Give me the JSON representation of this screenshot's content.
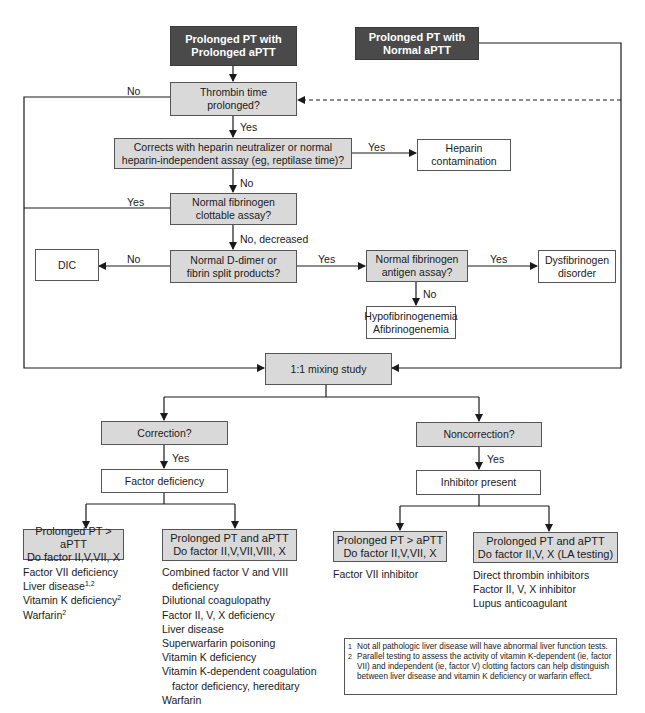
{
  "start_nodes": {
    "prolonged_both": [
      "Prolonged PT with",
      "Prolonged aPTT"
    ],
    "prolonged_pt_only": [
      "Prolonged PT with",
      "Normal aPTT"
    ]
  },
  "nodes": {
    "thrombin_time": [
      "Thrombin time",
      "prolonged?"
    ],
    "heparin_neutralizer": [
      "Corrects with heparin neutralizer or normal",
      "heparin-independent assay (eg, reptilase time)?"
    ],
    "heparin_contamination": [
      "Heparin",
      "contamination"
    ],
    "fibrinogen_clottable": [
      "Normal fibrinogen",
      "clottable assay?"
    ],
    "ddimer": [
      "Normal D-dimer or",
      "fibrin split products?"
    ],
    "dic": [
      "DIC"
    ],
    "fibrinogen_antigen": [
      "Normal fibrinogen",
      "antigen assay?"
    ],
    "dysfibrinogen": [
      "Dysfibrinogen",
      "disorder"
    ],
    "hypofibrinogenemia": [
      "Hypofibrinogenemia",
      "Afibrinogenemia"
    ],
    "mixing_study": [
      "1:1 mixing study"
    ],
    "correction": [
      "Correction?"
    ],
    "noncorrection": [
      "Noncorrection?"
    ],
    "factor_deficiency": [
      "Factor deficiency"
    ],
    "inhibitor_present": [
      "Inhibitor present"
    ],
    "def_pt_gt_aptt": [
      "Prolonged PT > aPTT",
      "Do factor II,V,VII, X"
    ],
    "def_pt_and_aptt": [
      "Prolonged PT and aPTT",
      "Do factor II,V,VII,VIII, X"
    ],
    "inh_pt_gt_aptt": [
      "Prolonged PT > aPTT",
      "Do factor II,V,VII, X"
    ],
    "inh_pt_and_aptt": [
      "Prolonged PT and aPTT",
      "Do factor II,V, X (LA testing)"
    ]
  },
  "edge_labels": {
    "thrombin_no": "No",
    "thrombin_yes": "Yes",
    "heparin_yes": "Yes",
    "heparin_no": "No",
    "fibrinogen_yes": "Yes",
    "fibrinogen_no": "No, decreased",
    "ddimer_no": "No",
    "ddimer_yes": "Yes",
    "antigen_yes": "Yes",
    "antigen_no": "No",
    "correction_yes": "Yes",
    "noncorrection_yes": "Yes"
  },
  "lists": {
    "def_pt_gt_aptt": [
      {
        "text": "Factor VII deficiency",
        "sup": ""
      },
      {
        "text": "Liver disease",
        "sup": "1,2"
      },
      {
        "text": "Vitamin K deficiency",
        "sup": "2"
      },
      {
        "text": "Warfarin",
        "sup": "2"
      }
    ],
    "def_pt_and_aptt": [
      {
        "text": "Combined factor V and VIII"
      },
      {
        "text": "deficiency",
        "indent": true
      },
      {
        "text": "Dilutional coagulopathy"
      },
      {
        "text": "Factor II, V, X deficiency"
      },
      {
        "text": "Liver disease"
      },
      {
        "text": "Superwarfarin poisoning"
      },
      {
        "text": "Vitamin K deficiency"
      },
      {
        "text": "Vitamin K-dependent coagulation"
      },
      {
        "text": "factor deficiency, hereditary",
        "indent": true
      },
      {
        "text": "Warfarin"
      }
    ],
    "inh_pt_gt_aptt": [
      {
        "text": "Factor VII inhibitor"
      }
    ],
    "inh_pt_and_aptt": [
      {
        "text": "Direct thrombin inhibitors"
      },
      {
        "text": "Factor II, V, X inhibitor"
      },
      {
        "text": "Lupus anticoagulant"
      }
    ]
  },
  "footnotes": [
    {
      "num": "1",
      "text": "Not all pathologic liver disease will have abnormal liver function tests."
    },
    {
      "num": "2",
      "text": "Parallel testing to assess the activity of vitamin K-dependent (ie, factor VII) and independent (ie, factor V) clotting factors can help distinguish between liver disease and vitamin K deficiency or warfarin effect."
    }
  ],
  "colors": {
    "start_node_fill": "#4a4a4a",
    "decision_fill": "#d9d9d9",
    "outcome_fill": "#ffffff",
    "line": "#1a1a1a"
  }
}
